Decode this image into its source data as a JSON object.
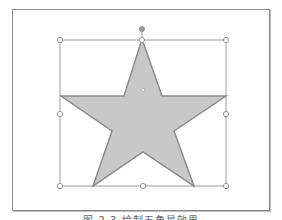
{
  "canvas": {
    "background": "#ffffff",
    "frame_border_color": "#8a8a8a"
  },
  "shape": {
    "type": "five-pointed-star",
    "fill": "#c8c8c8",
    "stroke": "#8c8c8c",
    "points": "142,39 162,96 226,96 174,131 194,186 143,152 93,186 112,131 61,96 124,96"
  },
  "selection": {
    "bounding_box": {
      "x": 60,
      "y": 40,
      "width": 166,
      "height": 146
    },
    "line_color": "#9a9a9a",
    "handle_color": "#9a9a9a",
    "rotation_handle": {
      "x": 142,
      "y": 29
    },
    "center_point": {
      "x": 143,
      "y": 90
    }
  },
  "caption": {
    "text": "图 2.3  绘制五角星效果"
  }
}
